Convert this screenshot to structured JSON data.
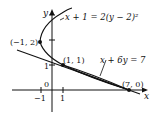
{
  "diagram": {
    "axes": {
      "x_label": "x",
      "y_label": "y",
      "origin_label": "0",
      "x_ticks": [
        "−1",
        "1"
      ],
      "y_ticks": [
        "1"
      ]
    },
    "curves": [
      {
        "name": "parabola",
        "equation": "x + 1 = 2(y − 2)²"
      },
      {
        "name": "line",
        "equation": "x + 6y = 7"
      }
    ],
    "points": [
      {
        "label": "(−1, 2)",
        "x": -1,
        "y": 2
      },
      {
        "label": "(1, 1)",
        "x": 1,
        "y": 1
      },
      {
        "label": "(7, 0)",
        "x": 7,
        "y": 0
      }
    ],
    "colors": {
      "ink": "#111111",
      "background": "#ffffff"
    }
  }
}
